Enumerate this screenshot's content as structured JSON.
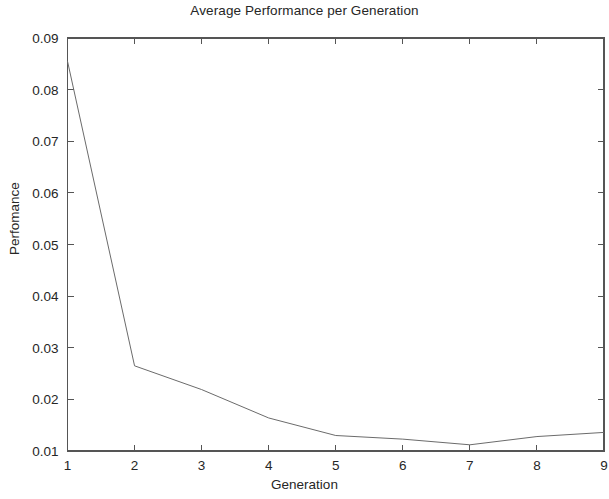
{
  "figure": {
    "title": "Average Performance per Generation",
    "background_color": "#ffffff",
    "axis_color": "#555555",
    "line_color": "#6b6b6b",
    "text_color": "#262626"
  },
  "chart_data": {
    "type": "line",
    "title": "Average Performance per Generation",
    "xlabel": "Generation",
    "ylabel": "Perfomance",
    "x": [
      1,
      2,
      3,
      4,
      5,
      6,
      7,
      8,
      9
    ],
    "values": [
      0.0855,
      0.0265,
      0.0219,
      0.0164,
      0.013,
      0.0123,
      0.0112,
      0.0128,
      0.0136
    ],
    "series": [
      {
        "name": "Average Performance",
        "values": [
          0.0855,
          0.0265,
          0.0219,
          0.0164,
          0.013,
          0.0123,
          0.0112,
          0.0128,
          0.0136
        ]
      }
    ],
    "xlim": [
      1,
      9
    ],
    "ylim": [
      0.01,
      0.09
    ],
    "xticks": [
      "1",
      "2",
      "3",
      "4",
      "5",
      "6",
      "7",
      "8",
      "9"
    ],
    "xtick_values": [
      1,
      2,
      3,
      4,
      5,
      6,
      7,
      8,
      9
    ],
    "yticks": [
      "0.01",
      "0.02",
      "0.03",
      "0.04",
      "0.05",
      "0.06",
      "0.07",
      "0.08",
      "0.09"
    ],
    "ytick_values": [
      0.01,
      0.02,
      0.03,
      0.04,
      0.05,
      0.06,
      0.07,
      0.08,
      0.09
    ],
    "grid": false,
    "legend": null,
    "legend_position": "none",
    "marker": "none",
    "line_style": "solid",
    "line_width": 1
  }
}
